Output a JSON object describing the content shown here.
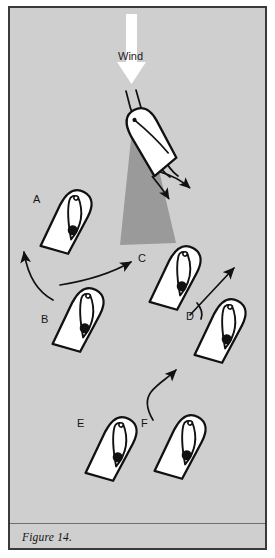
{
  "figure": {
    "caption": "Figure 14.",
    "wind_label": "Wind",
    "frame_color": "#3a3a3a",
    "background_color": "#cfcfcf",
    "page_color": "#ffffff",
    "nogo_zone_color": "#9a9a9a",
    "hull_fill": "#ffffff",
    "ink_color": "#111111",
    "wind_arrow_color": "#ffffff"
  },
  "boats": [
    {
      "id": "head-to-wind",
      "label": "",
      "x": 150,
      "y": 140,
      "rotation": -28,
      "note": "boat head to wind with luffing sails"
    },
    {
      "id": "A",
      "label": "A",
      "label_x": 33,
      "label_y": 194,
      "x": 68,
      "y": 222,
      "rotation": 28
    },
    {
      "id": "B",
      "label": "B",
      "label_x": 41,
      "label_y": 314,
      "x": 80,
      "y": 320,
      "rotation": 28
    },
    {
      "id": "C",
      "label": "C",
      "label_x": 138,
      "label_y": 253,
      "x": 177,
      "y": 278,
      "rotation": 28
    },
    {
      "id": "D",
      "label": "D",
      "label_x": 186,
      "label_y": 311,
      "x": 222,
      "y": 331,
      "rotation": 28
    },
    {
      "id": "E",
      "label": "E",
      "label_x": 77,
      "label_y": 418,
      "x": 113,
      "y": 449,
      "rotation": 28
    },
    {
      "id": "F",
      "label": "F",
      "label_x": 141,
      "label_y": 418,
      "x": 182,
      "y": 447,
      "rotation": 28
    }
  ],
  "arrows": [
    {
      "id": "wind-arrow",
      "kind": "wind",
      "direction": "down"
    },
    {
      "id": "stern-arrow-upper",
      "kind": "small",
      "from": "head-to-wind-stern"
    },
    {
      "id": "stern-arrow-lower",
      "kind": "small",
      "from": "head-to-wind-stern"
    },
    {
      "id": "arrow-b-to-a",
      "kind": "curved",
      "from": "B",
      "to": "A"
    },
    {
      "id": "arrow-b-to-c",
      "kind": "curved",
      "from": "B",
      "to": "C"
    },
    {
      "id": "arrow-c-to-d",
      "kind": "curved",
      "from": "C",
      "to": "D"
    },
    {
      "id": "arrow-c-up",
      "kind": "straight",
      "from": "C",
      "to": "upwind"
    },
    {
      "id": "arrow-f-up",
      "kind": "s-curve",
      "from": "F",
      "to": "upwind"
    },
    {
      "id": "arrow-e-to-f",
      "kind": "curved",
      "from": "E",
      "to": "F"
    }
  ]
}
